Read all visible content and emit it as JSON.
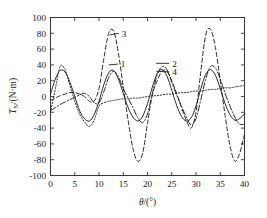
{
  "chart_data": {
    "type": "line",
    "title": "",
    "xlabel": "θ/(°)",
    "ylabel": "T_N/(N·m)",
    "ylabel_main": "T",
    "ylabel_sub": "N",
    "ylabel_unit": "/(N·m)",
    "xlim": [
      0,
      40
    ],
    "ylim": [
      -100,
      100
    ],
    "xticks": [
      0,
      5,
      10,
      15,
      20,
      25,
      30,
      35,
      40
    ],
    "xtick_labels": [
      "0",
      "5",
      "10",
      "15",
      "20",
      "25",
      "30",
      "35",
      "40"
    ],
    "yticks": [
      -100,
      -80,
      -60,
      -40,
      -20,
      0,
      20,
      40,
      60,
      80,
      100
    ],
    "ytick_labels": [
      "-100",
      "-80",
      "-60",
      "-40",
      "-20",
      "0",
      "20",
      "40",
      "60",
      "80",
      "100"
    ],
    "grid": false,
    "legend": "inline-callouts",
    "period_deg": 10,
    "series": [
      {
        "name": "1",
        "label": "1",
        "linestyle": "solid",
        "color": "#1f1f1f",
        "description": "Sinusoidal torque, amplitude ~33 N·m, period 10°, slowly decaying mean",
        "x": [
          0,
          1,
          2,
          3,
          4,
          5,
          6,
          7,
          8,
          9,
          10,
          11,
          12,
          13,
          14,
          15,
          16,
          17,
          18,
          19,
          20,
          21,
          22,
          23,
          24,
          25,
          26,
          27,
          28,
          29,
          30,
          31,
          32,
          33,
          34,
          35,
          36,
          37,
          38,
          39,
          40
        ],
        "y": [
          3,
          22,
          33,
          31,
          18,
          0,
          -18,
          -28,
          -31,
          -23,
          -6,
          15,
          30,
          33,
          22,
          4,
          -14,
          -26,
          -31,
          -25,
          -9,
          12,
          29,
          34,
          26,
          8,
          -11,
          -25,
          -31,
          -27,
          -12,
          10,
          28,
          34,
          27,
          10,
          -9,
          -23,
          -30,
          -28,
          -22
        ]
      },
      {
        "name": "2",
        "label": "2",
        "linestyle": "dashdot",
        "color": "#1f1f1f",
        "description": "Rising mean with ~30 N·m oscillation superposed, peaks around 40 N·m",
        "x": [
          0,
          1,
          2,
          3,
          4,
          5,
          6,
          7,
          8,
          9,
          10,
          11,
          12,
          13,
          14,
          15,
          16,
          17,
          18,
          19,
          20,
          21,
          22,
          23,
          24,
          25,
          26,
          27,
          28,
          29,
          30,
          31,
          32,
          33,
          34,
          35,
          36,
          37,
          38,
          39,
          40
        ],
        "y": [
          -18,
          -14,
          -10,
          -7,
          -4,
          -1,
          2,
          4,
          0,
          -8,
          -8,
          6,
          24,
          32,
          25,
          10,
          -2,
          -14,
          -27,
          -33,
          -22,
          4,
          27,
          38,
          34,
          18,
          2,
          -12,
          -26,
          -36,
          -28,
          -4,
          22,
          38,
          36,
          22,
          4,
          -12,
          -26,
          -35,
          -35
        ]
      },
      {
        "name": "3",
        "label": "3",
        "linestyle": "dashed",
        "color": "#1f1f1f",
        "description": "Largest amplitude curve, peaks ~83-85 N·m, troughs ~-82 N·m",
        "x": [
          0,
          1,
          2,
          3,
          4,
          5,
          6,
          7,
          8,
          9,
          10,
          11,
          12,
          13,
          14,
          15,
          16,
          17,
          18,
          19,
          20,
          21,
          22,
          23,
          24,
          25,
          26,
          27,
          28,
          29,
          30,
          31,
          32,
          33,
          34,
          35,
          36,
          37,
          38,
          39,
          40
        ],
        "y": [
          -5,
          -2,
          1,
          3,
          5,
          5,
          3,
          0,
          -6,
          -6,
          10,
          48,
          80,
          83,
          55,
          12,
          -30,
          -66,
          -82,
          -72,
          -34,
          2,
          20,
          32,
          32,
          20,
          4,
          -14,
          -30,
          -40,
          -20,
          32,
          78,
          85,
          62,
          20,
          -24,
          -62,
          -82,
          -72,
          -48
        ]
      },
      {
        "name": "4",
        "label": "4",
        "linestyle": "dotted",
        "color": "#1f1f1f",
        "description": "Gently rising baseline from ~-20 to ~+14 N·m with small ripple",
        "x": [
          0,
          1,
          2,
          3,
          4,
          5,
          6,
          7,
          8,
          9,
          10,
          11,
          12,
          13,
          14,
          15,
          16,
          17,
          18,
          19,
          20,
          21,
          22,
          23,
          24,
          25,
          26,
          27,
          28,
          29,
          30,
          31,
          32,
          33,
          34,
          35,
          36,
          37,
          38,
          39,
          40
        ],
        "y": [
          -20,
          10,
          38,
          34,
          14,
          -6,
          -22,
          -32,
          -38,
          -30,
          -12,
          -8,
          -6,
          -5,
          -4,
          -3,
          -3,
          -2,
          -2,
          -1,
          0,
          1,
          1,
          2,
          3,
          3,
          4,
          5,
          5,
          6,
          7,
          7,
          8,
          9,
          9,
          10,
          11,
          11,
          12,
          13,
          14
        ]
      }
    ],
    "annotations": [
      {
        "label": "3",
        "x_deg": 12.2,
        "y_val": 78,
        "text_x_deg": 14.6,
        "text_y_val": 80
      },
      {
        "label": "1",
        "x_deg": 12.0,
        "y_val": 40,
        "text_x_deg": 14.4,
        "text_y_val": 41
      },
      {
        "label": "2",
        "x_deg": 21.8,
        "y_val": 42,
        "text_x_deg": 25.0,
        "text_y_val": 42
      },
      {
        "label": "4",
        "x_deg": 21.8,
        "y_val": 32,
        "text_x_deg": 25.0,
        "text_y_val": 31
      }
    ]
  }
}
